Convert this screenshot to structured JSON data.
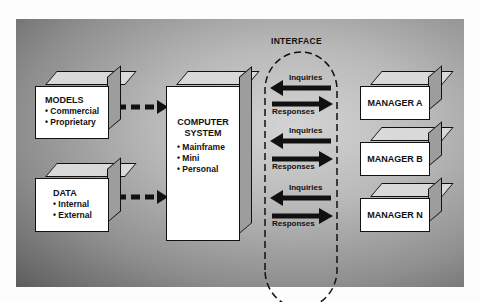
{
  "interface": {
    "title": "INTERFACE"
  },
  "models": {
    "title": "MODELS",
    "items": [
      "Commercial",
      "Proprietary"
    ]
  },
  "data": {
    "title": "DATA",
    "items": [
      "Internal",
      "External"
    ]
  },
  "computer": {
    "title_line1": "COMPUTER",
    "title_line2": "SYSTEM",
    "items": [
      "Mainframe",
      "Mini",
      "Personal"
    ]
  },
  "exchanges": [
    {
      "inquiries": "Inquiries",
      "responses": "Responses"
    },
    {
      "inquiries": "Inquiries",
      "responses": "Responses"
    },
    {
      "inquiries": "Inquiries",
      "responses": "Responses"
    }
  ],
  "managers": [
    {
      "label": "MANAGER A"
    },
    {
      "label": "MANAGER B"
    },
    {
      "label": "MANAGER N"
    }
  ]
}
